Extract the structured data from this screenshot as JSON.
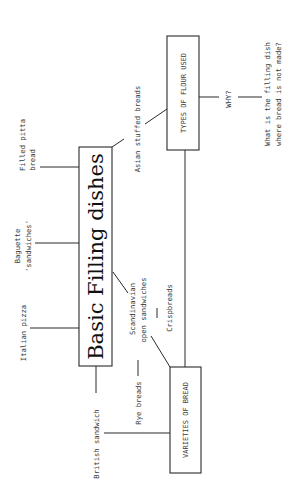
{
  "diagram": {
    "central_node": "Basic Filling dishes",
    "boxes": {
      "flour": "TYPES OF FLOUR USED",
      "varieties": "VARIETIES OF BREAD"
    },
    "branches": {
      "filled_pitta_line1": "Filled pitta",
      "filled_pitta_line2": "bread",
      "baguette_line1": "Baguette",
      "baguette_line2": "'sandwiches'",
      "italian_pizza": "Italian pizza",
      "british_sandwich": "British sandwich",
      "asian_stuffed": "Asian stuffed breads",
      "scandinavian_line1": "Scandinavian",
      "scandinavian_line2": "open sandwiches",
      "crispbreads": "Crispbreads",
      "rye_breads": "Rye breads"
    },
    "why_label": "WHY?",
    "question_line1": "What is the filling dish",
    "question_line2": "where bread is not made?"
  }
}
